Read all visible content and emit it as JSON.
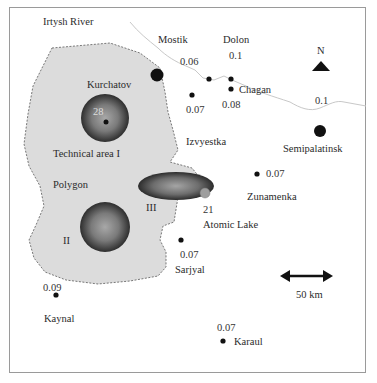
{
  "map": {
    "river_label": "Irtysh River",
    "polygon_label": "Polygon",
    "technical_area_label": "Technical area I",
    "zones": [
      {
        "id": "I",
        "label": "",
        "value": "28"
      },
      {
        "id": "II",
        "label": "II"
      },
      {
        "id": "III",
        "label": "III"
      }
    ],
    "atomic_lake": {
      "label": "Atomic Lake",
      "value": "21"
    },
    "north_label": "N",
    "scale_label": "50 km",
    "settlements": [
      {
        "name": "Kurchatov",
        "value": ""
      },
      {
        "name": "Mostik",
        "value": "0.06"
      },
      {
        "name": "Dolon",
        "value": "0.1"
      },
      {
        "name": "Chagan",
        "value": "0.08"
      },
      {
        "name": "",
        "value": "0.07"
      },
      {
        "name": "Semipalatinsk",
        "value": "0.1"
      },
      {
        "name": "Izvyestka",
        "value": ""
      },
      {
        "name": "Zunamenka",
        "value": "0.07"
      },
      {
        "name": "Sarjyal",
        "value": "0.07"
      },
      {
        "name": "Kaynal",
        "value": "0.09"
      },
      {
        "name": "Karaul",
        "value": "0.07"
      }
    ]
  },
  "colors": {
    "polygon_fill": "#dcdcdc",
    "zone_dark": "#333333",
    "zone_light": "#9a9a9a",
    "dot": "#111111",
    "river": "#c8c8c8",
    "frame": "#9a9a9a"
  }
}
